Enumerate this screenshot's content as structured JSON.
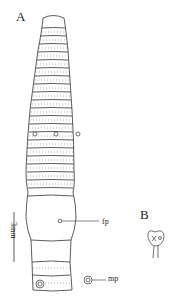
{
  "figure": {
    "panel_a_label": "A",
    "panel_b_label": "B",
    "scale_bar_label": "3mm",
    "annotations": {
      "female_pore": "fp",
      "male_pore": "mp"
    }
  }
}
